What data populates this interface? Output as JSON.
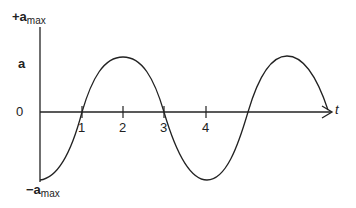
{
  "diagram": {
    "type": "acceleration-time graph",
    "y_axis": {
      "label": "a",
      "top_label": {
        "sign": "+",
        "var": "a",
        "sub": "max"
      },
      "bottom_label": {
        "sign": "−",
        "var": "a",
        "sub": "max"
      },
      "zero_label": "0"
    },
    "x_axis": {
      "label": "t",
      "ticks": [
        "1",
        "2",
        "3",
        "4"
      ]
    },
    "curve": "a = -a_max cos(π t / 2)"
  }
}
